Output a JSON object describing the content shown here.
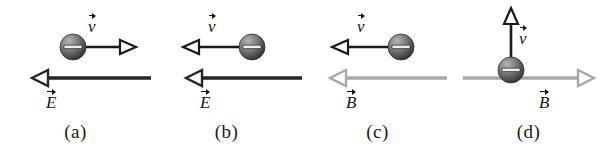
{
  "figure": {
    "kind": "physics-force-diagram",
    "background_color": "#ffffff",
    "colors": {
      "electric_field_arrow": "#262626",
      "magnetic_field_arrow": "#a8a8a8",
      "velocity_arrow": "#1a1a1a",
      "charge_fill_light": "#8e8e8e",
      "charge_fill_dark": "#3a3a3a",
      "label_text": "#1a1a1a"
    }
  },
  "panels": [
    {
      "id": "a",
      "label": "(a)",
      "charge": {
        "sign": "−",
        "sign_name": "minus-sign",
        "position": "left"
      },
      "velocity": {
        "symbol": "v",
        "direction": "right",
        "label_position": "above-right"
      },
      "field": {
        "symbol": "E",
        "type": "electric",
        "direction": "left",
        "color": "#262626",
        "label_position": "below-left"
      }
    },
    {
      "id": "b",
      "label": "(b)",
      "charge": {
        "sign": "−",
        "sign_name": "minus-sign",
        "position": "right"
      },
      "velocity": {
        "symbol": "v",
        "direction": "left",
        "label_position": "above-center"
      },
      "field": {
        "symbol": "E",
        "type": "electric",
        "direction": "left",
        "color": "#262626",
        "label_position": "below-left"
      }
    },
    {
      "id": "c",
      "label": "(c)",
      "charge": {
        "sign": "−",
        "sign_name": "minus-sign",
        "position": "right"
      },
      "velocity": {
        "symbol": "v",
        "direction": "left",
        "label_position": "above-center"
      },
      "field": {
        "symbol": "B",
        "type": "magnetic",
        "direction": "left",
        "color": "#a8a8a8",
        "label_position": "below-left"
      }
    },
    {
      "id": "d",
      "label": "(d)",
      "charge": {
        "sign": "−",
        "sign_name": "minus-sign",
        "position": "center-on-field-line"
      },
      "velocity": {
        "symbol": "v",
        "direction": "up",
        "label_position": "right-of-shaft"
      },
      "field": {
        "symbol": "B",
        "type": "magnetic",
        "direction": "right",
        "color": "#a8a8a8",
        "label_position": "below-right"
      }
    }
  ]
}
